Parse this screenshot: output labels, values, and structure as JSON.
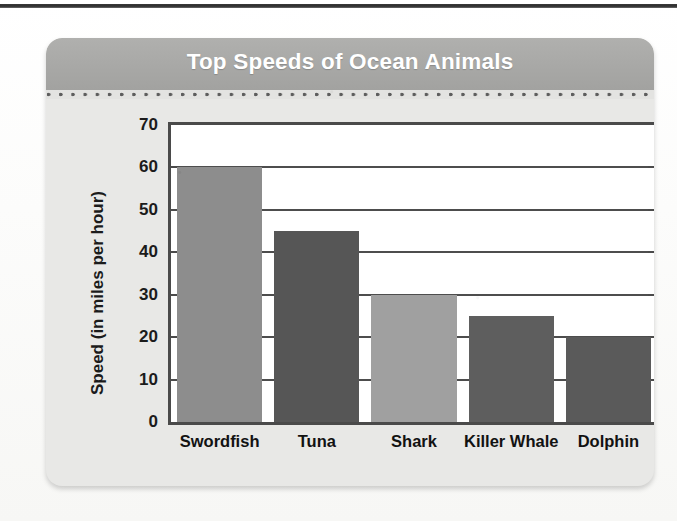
{
  "page": {
    "background_color": "#fbfbfa",
    "top_rule_color": "#2e2e2e"
  },
  "card": {
    "background_color": "#e8e8e6",
    "title_bar_color": "#a8a8a6",
    "title_text_color": "#ffffff",
    "dotted_rule_color": "#5d5d5d"
  },
  "chart_data": {
    "type": "bar",
    "title": "Top Speeds of Ocean Animals",
    "xlabel": "Animal",
    "ylabel": "Speed (in miles per hour)",
    "categories": [
      "Swordfish",
      "Tuna",
      "Shark",
      "Killer Whale",
      "Dolphin"
    ],
    "values": [
      60,
      45,
      30,
      25,
      20
    ],
    "bar_colors": [
      "#8d8d8d",
      "#565656",
      "#a0a0a0",
      "#5e5e5e",
      "#5a5a5a"
    ],
    "ylim": [
      0,
      70
    ],
    "ytick_labels": [
      "70",
      "60",
      "50",
      "40",
      "30",
      "20",
      "10",
      "0"
    ],
    "ytick_values": [
      70,
      60,
      50,
      40,
      30,
      20,
      10,
      0
    ],
    "ytick_step": 10,
    "gridlines_at": [
      60,
      50,
      40,
      30,
      20,
      10
    ],
    "grid": true,
    "legend": "none",
    "frame_color": "#4a4a4a",
    "plot_background": "#ffffff"
  }
}
